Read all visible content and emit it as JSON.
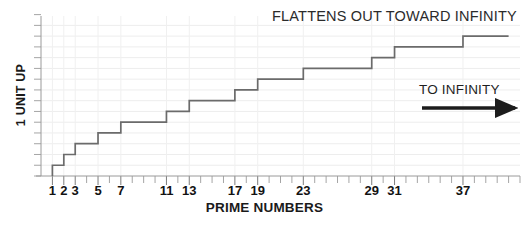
{
  "chart_data": {
    "type": "line",
    "subtype": "step",
    "title": "",
    "xlabel": "PRIME NUMBERS",
    "ylabel": "1 UNIT UP",
    "xlim": [
      0,
      42
    ],
    "ylim": [
      0,
      14.5
    ],
    "grid": true,
    "legend": null,
    "x_tick_labels": [
      "1",
      "2",
      "3",
      "5",
      "7",
      "11",
      "13",
      "17",
      "19",
      "23",
      "29",
      "31",
      "37"
    ],
    "x_tick_values": [
      1,
      2,
      3,
      5,
      7,
      11,
      13,
      17,
      19,
      23,
      29,
      31,
      37
    ],
    "x_minor_ticks_every": 1,
    "y_tick_labels": [],
    "series": [
      {
        "name": "prime counting function",
        "step_x": [
          1,
          2,
          3,
          5,
          7,
          11,
          13,
          17,
          19,
          23,
          29,
          31,
          37
        ],
        "step_y": [
          1,
          2,
          3,
          4,
          5,
          6,
          7,
          8,
          9,
          10,
          11,
          12,
          13
        ],
        "x_end": 41,
        "color": "#6b6b6b"
      }
    ],
    "annotations": [
      {
        "id": "flattens",
        "text": "FLATTENS OUT TOWARD INFINITY",
        "x": 272,
        "y": 8
      },
      {
        "id": "to-infinity",
        "text": "TO INFINITY",
        "x": 419,
        "y": 82
      }
    ],
    "colors": {
      "step_line": "#6b6b6b",
      "axis": "#9a9a9a",
      "grid": "#ededed",
      "text": "#1a1a1a",
      "arrow": "#1c1c1c",
      "background": "#ffffff"
    }
  },
  "axes": {
    "x_label": "PRIME NUMBERS",
    "y_label": "1 UNIT UP"
  },
  "annotations": {
    "flattens_out": "FLATTENS OUT TOWARD INFINITY",
    "to_infinity": "TO INFINITY"
  },
  "ticks": {
    "x": [
      "1",
      "2",
      "3",
      "5",
      "7",
      "11",
      "13",
      "17",
      "19",
      "23",
      "29",
      "31",
      "37"
    ]
  }
}
